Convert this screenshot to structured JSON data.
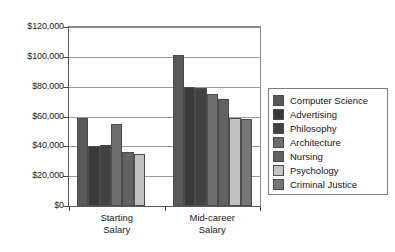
{
  "chart_data": {
    "type": "bar",
    "title": "",
    "subtitle": "",
    "xlabel": "",
    "ylabel": "",
    "categories": [
      "Starting\nSalary",
      "Mid-career\nSalary"
    ],
    "category_labels_plain": [
      "Starting Salary",
      "Mid-career Salary"
    ],
    "ylim": [
      0,
      120000
    ],
    "ytick_values": [
      0,
      20000,
      40000,
      60000,
      80000,
      100000,
      120000
    ],
    "ytick_labels": [
      "$0",
      "$20,000",
      "$40,000",
      "$60,000",
      "$80,000",
      "$100,000",
      "$120,000"
    ],
    "grid": true,
    "grid_axis": "y",
    "legend_position": "right",
    "series": [
      {
        "name": "Computer Science",
        "color": "#585858",
        "values": [
          59000,
          101000
        ]
      },
      {
        "name": "Advertising",
        "color": "#3a3a3a",
        "values": [
          40000,
          80000
        ]
      },
      {
        "name": "Philosophy",
        "color": "#424242",
        "values": [
          41000,
          79000
        ]
      },
      {
        "name": "Architecture",
        "color": "#6e6e6e",
        "values": [
          55000,
          75000
        ]
      },
      {
        "name": "Nursing",
        "color": "#626262",
        "values": [
          36000,
          72000
        ]
      },
      {
        "name": "Psychology",
        "color": "#c2c2c2",
        "values": [
          35000,
          59000
        ]
      },
      {
        "name": "Criminal Justice",
        "color": "#767676",
        "values": [
          0,
          58000
        ]
      }
    ]
  },
  "legend": {
    "items": [
      {
        "label": "Computer Science"
      },
      {
        "label": "Advertising"
      },
      {
        "label": "Philosophy"
      },
      {
        "label": "Architecture"
      },
      {
        "label": "Nursing"
      },
      {
        "label": "Psychology"
      },
      {
        "label": "Criminal Justice"
      }
    ]
  }
}
